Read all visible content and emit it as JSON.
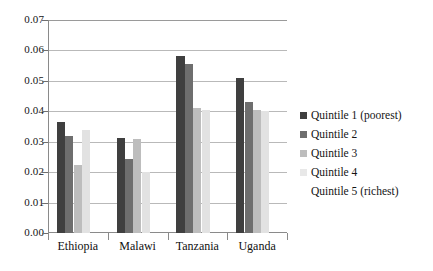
{
  "chart_data": {
    "type": "bar",
    "title": "",
    "subtitle": "",
    "xlabel": "",
    "ylabel": "",
    "ylim": [
      0.0,
      0.07
    ],
    "ytick_labels": [
      "0.00",
      "0.01",
      "0.02",
      "0.03",
      "0.04",
      "0.05",
      "0.06",
      "0.07"
    ],
    "ytick_values": [
      0.0,
      0.01,
      0.02,
      0.03,
      0.04,
      0.05,
      0.06,
      0.07
    ],
    "grid": "horizontal",
    "legend_position": "right",
    "categories": [
      "Ethiopia",
      "Malawi",
      "Tanzania",
      "Uganda"
    ],
    "series": [
      {
        "name": "Quintile 1 (poorest)",
        "color": "#3f3f3f",
        "values": [
          0.0365,
          0.0313,
          0.0582,
          0.0508
        ]
      },
      {
        "name": "Quintile 2",
        "color": "#6e6e6e",
        "values": [
          0.0318,
          0.0243,
          0.0557,
          0.043
        ]
      },
      {
        "name": "Quintile 3",
        "color": "#bdbdbd",
        "values": [
          0.0222,
          0.0308,
          0.041,
          0.0405
        ]
      },
      {
        "name": "Quintile 4",
        "color": "#e2e2e2",
        "values": [
          0.034,
          0.02,
          0.0403,
          0.04
        ]
      },
      {
        "name": "Quintile 5 (richest)",
        "color": "#fcfcfc",
        "values": [
          0.0,
          0.0,
          0.0,
          0.0
        ]
      }
    ]
  },
  "legend": {
    "items": [
      {
        "label": "Quintile 1 (poorest)",
        "color": "#3f3f3f"
      },
      {
        "label": "Quintile 2",
        "color": "#6e6e6e"
      },
      {
        "label": "Quintile 3",
        "color": "#bdbdbd"
      },
      {
        "label": "Quintile 4",
        "color": "#e8e8e8"
      },
      {
        "label": "Quintile 5 (richest)",
        "color": "#ffffff"
      }
    ]
  }
}
